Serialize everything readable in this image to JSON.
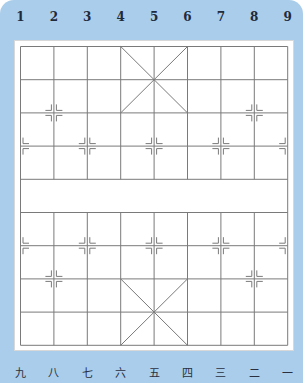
{
  "board": {
    "type": "xiangqi",
    "title": "Chinese chess board",
    "columns": 9,
    "rows": 10,
    "river_between_rows": [
      4,
      5
    ],
    "background_color": "#a9cdea",
    "line_color": "#7a7a7a",
    "top_labels": [
      "1",
      "2",
      "3",
      "4",
      "5",
      "6",
      "7",
      "8",
      "9"
    ],
    "bottom_labels": [
      "九",
      "八",
      "七",
      "六",
      "五",
      "四",
      "三",
      "二",
      "一"
    ],
    "palaces": [
      {
        "cols": [
          3,
          5
        ],
        "rows": [
          0,
          2
        ]
      },
      {
        "cols": [
          3,
          5
        ],
        "rows": [
          7,
          9
        ]
      }
    ],
    "markers": [
      {
        "col": 1,
        "row": 2
      },
      {
        "col": 7,
        "row": 2
      },
      {
        "col": 0,
        "row": 3
      },
      {
        "col": 2,
        "row": 3
      },
      {
        "col": 4,
        "row": 3
      },
      {
        "col": 6,
        "row": 3
      },
      {
        "col": 8,
        "row": 3
      },
      {
        "col": 0,
        "row": 6
      },
      {
        "col": 2,
        "row": 6
      },
      {
        "col": 4,
        "row": 6
      },
      {
        "col": 6,
        "row": 6
      },
      {
        "col": 8,
        "row": 6
      },
      {
        "col": 1,
        "row": 7
      },
      {
        "col": 7,
        "row": 7
      }
    ]
  }
}
